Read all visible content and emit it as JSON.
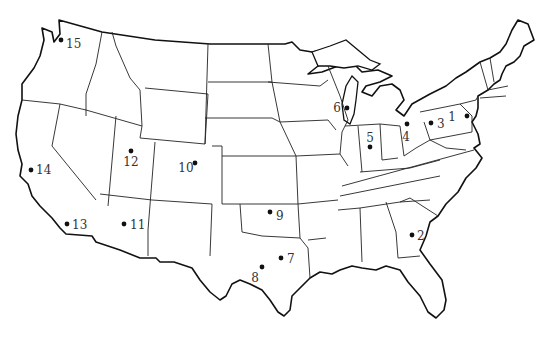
{
  "map": {
    "title": "",
    "region": "Contiguous United States",
    "marker_color": "#111111",
    "markers": [
      {
        "id": "1",
        "x": 467,
        "y": 116,
        "lx": 456,
        "ly": 121,
        "anchor": "end"
      },
      {
        "id": "2",
        "x": 412,
        "y": 235,
        "lx": 417,
        "ly": 240,
        "anchor": "start"
      },
      {
        "id": "3",
        "x": 431,
        "y": 123,
        "lx": 437,
        "ly": 128,
        "anchor": "start"
      },
      {
        "id": "4",
        "x": 407,
        "y": 124,
        "lx": 406,
        "ly": 141,
        "anchor": "middle"
      },
      {
        "id": "5",
        "x": 370,
        "y": 147,
        "lx": 370,
        "ly": 142,
        "anchor": "middle"
      },
      {
        "id": "6",
        "x": 347,
        "y": 108,
        "lx": 341,
        "ly": 112,
        "anchor": "end"
      },
      {
        "id": "7",
        "x": 281,
        "y": 258,
        "lx": 287,
        "ly": 263,
        "anchor": "start"
      },
      {
        "id": "8",
        "x": 262,
        "y": 267,
        "lx": 255,
        "ly": 282,
        "anchor": "middle"
      },
      {
        "id": "9",
        "x": 270,
        "y": 212,
        "lx": 276,
        "ly": 220,
        "anchor": "start"
      },
      {
        "id": "10",
        "x": 195,
        "y": 163,
        "lx": 186,
        "ly": 172,
        "anchor": "middle"
      },
      {
        "id": "12",
        "x": 131,
        "y": 151,
        "lx": 131,
        "ly": 166,
        "anchor": "middle"
      },
      {
        "id": "11",
        "x": 124,
        "y": 224,
        "lx": 130,
        "ly": 229,
        "anchor": "start"
      },
      {
        "id": "13",
        "x": 67,
        "y": 224,
        "lx": 72,
        "ly": 229,
        "anchor": "start"
      },
      {
        "id": "14",
        "x": 31,
        "y": 170,
        "lx": 36,
        "ly": 174,
        "anchor": "start"
      },
      {
        "id": "15",
        "x": 61,
        "y": 40,
        "lx": 66,
        "ly": 48,
        "anchor": "start"
      }
    ]
  }
}
